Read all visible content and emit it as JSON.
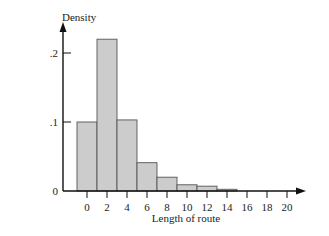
{
  "chart_data": {
    "type": "bar",
    "title": "",
    "xlabel": "Length of route",
    "ylabel": "Density",
    "x_ticks": [
      "0",
      "2",
      "4",
      "6",
      "8",
      "10",
      "12",
      "14",
      "16",
      "18",
      "20"
    ],
    "y_ticks": [
      "0",
      ".1",
      ".2"
    ],
    "ylim": [
      0,
      0.24
    ],
    "xlim": [
      -2,
      21
    ],
    "bin_width": 2,
    "categories": [
      "0",
      "2",
      "4",
      "6",
      "8",
      "10",
      "12",
      "14"
    ],
    "bins": [
      [
        -1,
        1
      ],
      [
        1,
        3
      ],
      [
        3,
        5
      ],
      [
        5,
        7
      ],
      [
        7,
        9
      ],
      [
        9,
        11
      ],
      [
        11,
        13
      ],
      [
        13,
        15
      ]
    ],
    "values": [
      0.1,
      0.22,
      0.103,
      0.041,
      0.02,
      0.009,
      0.007,
      0.0025
    ],
    "bar_color": "#cccccc",
    "edge_color": "#555555",
    "grid": false,
    "legend": null
  }
}
